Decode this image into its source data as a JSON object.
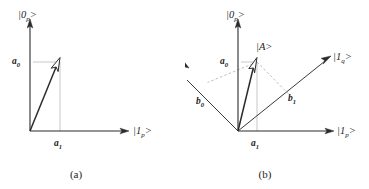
{
  "figure": {
    "panels": [
      {
        "id": "a",
        "caption": "(a)",
        "axes": [
          {
            "name": "vertical-axis",
            "label_base": "|0",
            "label_sub": "p",
            "label_close": ">"
          },
          {
            "name": "horizontal-axis",
            "label_base": "|1",
            "label_sub": "p",
            "label_close": ">"
          }
        ],
        "labels": {
          "a0_base": "a",
          "a0_sub": "0",
          "a1_base": "a",
          "a1_sub": "1"
        },
        "vectors": [
          {
            "name": "state-vector",
            "head": "hollow"
          }
        ]
      },
      {
        "id": "b",
        "caption": "(b)",
        "axes": [
          {
            "name": "vertical-axis",
            "label_base": "|0",
            "label_sub": "p",
            "label_close": ">"
          },
          {
            "name": "horizontal-axis",
            "label_base": "|1",
            "label_sub": "p",
            "label_close": ">"
          },
          {
            "name": "q-zero-axis",
            "label_base": "|0",
            "label_sub": "q",
            "label_close": ">"
          },
          {
            "name": "q-one-axis",
            "label_base": "|1",
            "label_sub": "q",
            "label_close": ">"
          }
        ],
        "labels": {
          "a0_base": "a",
          "a0_sub": "0",
          "a1_base": "a",
          "a1_sub": "1",
          "b0_base": "b",
          "b0_sub": "0",
          "b1_base": "b",
          "b1_sub": "1",
          "state_ket": "|A>"
        },
        "vectors": [
          {
            "name": "state-vector",
            "head": "hollow"
          }
        ]
      }
    ],
    "colors": {
      "ink": "#1c1c1c",
      "axis": "#2b2b2b",
      "projection": "#b9b9b9",
      "background": "#ffffff"
    }
  }
}
